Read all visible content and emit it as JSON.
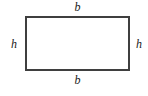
{
  "figure": {
    "type": "geometry-diagram",
    "shape": "rectangle",
    "background_color": "#ffffff",
    "stroke_color": "#3f3f3f",
    "label_color": "#1a1a1a",
    "labels": {
      "top": "b",
      "bottom": "b",
      "left": "h",
      "right": "h"
    }
  }
}
